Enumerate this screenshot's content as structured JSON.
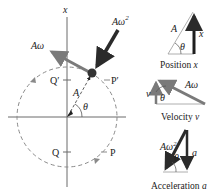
{
  "main_diagram": {
    "axis_label": "x",
    "radius_label": "A",
    "angle_label": "θ",
    "velocity_label": "Aω",
    "acceleration_label": "Aω",
    "acceleration_exp": "2",
    "points": {
      "P": "P",
      "P_prime": "P′",
      "Q": "Q",
      "Q_prime": "Q′"
    }
  },
  "panels": [
    {
      "name": "position",
      "caption_prefix": "Position ",
      "caption_var": "x",
      "hyp_label": "A",
      "side_label": "x",
      "angle_label": "θ"
    },
    {
      "name": "velocity",
      "caption_prefix": "Velocity ",
      "caption_var": "v",
      "hyp_label": "Aω",
      "side_label": "v",
      "angle_label": "θ"
    },
    {
      "name": "acceleration",
      "caption_prefix": "Acceleration ",
      "caption_var": "a",
      "hyp_label": "Aω",
      "hyp_exp": "2",
      "side_label": "a",
      "angle_label": "θ"
    }
  ],
  "colors": {
    "axis": "#6b6b6b",
    "circle": "#8a8a8a",
    "velocity_arrow": "#7a7a7a",
    "acceleration_arrow": "#2b2b2b",
    "ball": "#333333",
    "triangle_line": "#9a9a9a"
  }
}
